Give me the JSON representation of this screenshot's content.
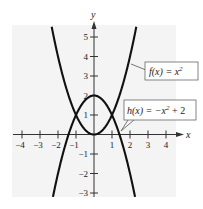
{
  "chart_data": {
    "type": "line",
    "title": "",
    "xlabel": "x",
    "ylabel": "y",
    "xlim": [
      -4.5,
      4.9
    ],
    "ylim": [
      -3.3,
      5.7
    ],
    "grid": false,
    "legend_position": "callouts",
    "x_ticks": [
      -4,
      -3,
      -2,
      -1,
      1,
      2,
      3,
      4
    ],
    "y_ticks": [
      -3,
      -2,
      -1,
      1,
      2,
      3,
      4,
      5
    ],
    "x_tick_labels": [
      "−4",
      "−3",
      "−2",
      "−1",
      "1",
      "2",
      "3",
      "4"
    ],
    "y_tick_labels": [
      "−3",
      "−2",
      "−1",
      "1",
      "2",
      "3",
      "4",
      "5"
    ],
    "series": [
      {
        "name": "f(x) = x²",
        "expression": "x^2",
        "x_range": [
          -2.35,
          2.35
        ],
        "points": [
          [
            -2.3,
            5.29
          ],
          [
            -2,
            4
          ],
          [
            -1.5,
            2.25
          ],
          [
            -1,
            1
          ],
          [
            -0.5,
            0.25
          ],
          [
            0,
            0
          ],
          [
            0.5,
            0.25
          ],
          [
            1,
            1
          ],
          [
            1.5,
            2.25
          ],
          [
            2,
            4
          ],
          [
            2.3,
            5.29
          ]
        ]
      },
      {
        "name": "h(x) = −x² + 2",
        "expression": "-x^2+2",
        "x_range": [
          -2.28,
          2.28
        ],
        "points": [
          [
            -2.25,
            -3.06
          ],
          [
            -2,
            -2
          ],
          [
            -1.5,
            -0.25
          ],
          [
            -1,
            1
          ],
          [
            -0.5,
            1.75
          ],
          [
            0,
            2
          ],
          [
            0.5,
            1.75
          ],
          [
            1,
            1
          ],
          [
            1.5,
            -0.25
          ],
          [
            2,
            -2
          ],
          [
            2.25,
            -3.06
          ]
        ]
      }
    ],
    "intersections": [
      [
        -1,
        1
      ],
      [
        1,
        1
      ]
    ],
    "annotations": [
      {
        "label_prefix": "f(x) = x",
        "superscript": "2",
        "suffix": "",
        "points_to": [
          1.95,
          3.8
        ]
      },
      {
        "label_prefix": "h(x) = −x",
        "superscript": "2",
        "suffix": " + 2",
        "points_to": [
          1.5,
          -0.25
        ]
      }
    ]
  },
  "labels": {
    "x_axis": "x",
    "y_axis": "y",
    "f_prefix": "f(x) = x",
    "f_sup": "2",
    "h_prefix": "h(x) = −x",
    "h_sup": "2",
    "h_suffix": " + 2"
  },
  "colors": {
    "background": "#ffffff",
    "plot_background": "#f4f4f4",
    "curve": "#111111",
    "axis": "#333333"
  }
}
